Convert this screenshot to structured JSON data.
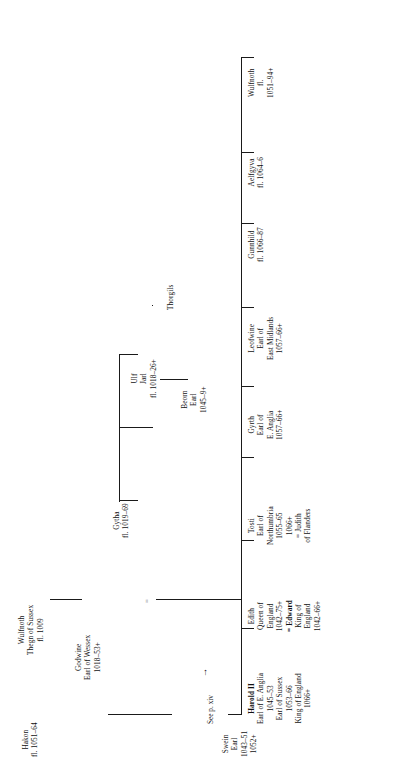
{
  "chart": {
    "orientation": "rotated-90-ccw",
    "root": {
      "name": "Thorgils"
    }
  },
  "people": {
    "thorgils": {
      "lines": [
        "Thorgils"
      ]
    },
    "ulf": {
      "lines": [
        "Ulf",
        "Jarl",
        "fl. 1018–26+"
      ]
    },
    "gytha": {
      "lines": [
        "Gytha",
        "fl. 1019–69"
      ]
    },
    "beorn": {
      "lines": [
        "Beorn",
        "Earl",
        "1045–9+"
      ]
    },
    "wulfnoth_thegn": {
      "lines": [
        "Wulfnoth",
        "Thegn of Sussex",
        "fl. 1009"
      ]
    },
    "godwine": {
      "lines": [
        "Godwine",
        "Earl of Wessex",
        "1018–53+"
      ]
    },
    "swein": {
      "lines": [
        "Swein",
        "Earl",
        "1043–51",
        "1052+"
      ]
    },
    "hakon": {
      "lines": [
        "Hakon",
        "fl. 1051–64"
      ]
    },
    "harold": {
      "lines": [
        "Harold II",
        "Earl of E. Anglia",
        "1045–53",
        "Earl of Sussex",
        "1053–66",
        "King of England",
        "1066+"
      ],
      "bold_lines": [
        0
      ]
    },
    "edith": {
      "lines": [
        "Edith",
        "Queen of",
        "England",
        "1042–75+",
        "= Edward",
        "King of",
        "England",
        "1042–66+"
      ],
      "bold_lines": [
        4
      ]
    },
    "tosti": {
      "lines": [
        "Tosti",
        "Earl of",
        "Northumbria",
        "1055–65",
        "1066+",
        "= Judith",
        "of Flanders"
      ]
    },
    "gyrth": {
      "lines": [
        "Gyrth",
        "Earl of",
        "E. Anglia",
        "1057–66+"
      ]
    },
    "leofwine": {
      "lines": [
        "Leofwine",
        "Earl of",
        "East Midlands",
        "1057–66+"
      ]
    },
    "gunnhild": {
      "lines": [
        "Gunnhild",
        "fl. 1066–87"
      ]
    },
    "aelfgyva": {
      "lines": [
        "Aelfgyva",
        "fl. 1064–6"
      ]
    },
    "wulfnoth_son": {
      "lines": [
        "Wulfnoth",
        "fl.",
        "1051–94+"
      ]
    }
  },
  "annotations": {
    "see_page": "See p. xiv",
    "arrow": "→",
    "marriage_symbol": "="
  },
  "colors": {
    "line": "#1a1a1a",
    "text": "#111111",
    "background": "#ffffff"
  }
}
